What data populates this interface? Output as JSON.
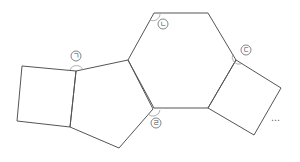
{
  "diagram": {
    "colors": {
      "stroke": "#555555",
      "arc": "#9a9a9a",
      "text": "#444444"
    },
    "shapes": [
      {
        "name": "left-square",
        "points": "22,66 76,71 70,127 17,121"
      },
      {
        "name": "pentagon",
        "points": "76,71 128,60 153,109 119,148 70,127"
      },
      {
        "name": "hexagon",
        "points": "154,13 208,13 236,60 208,108 154,108 128,60"
      },
      {
        "name": "right-square",
        "points": "236,60 281,88 254,135 208,108"
      }
    ],
    "angle_labels": [
      {
        "id": "a",
        "text": "ㄱ",
        "x": 76,
        "y": 56,
        "arc": "M70,70 A7,7 0 0 1 83,70"
      },
      {
        "id": "b",
        "text": "ㄴ",
        "x": 163,
        "y": 24,
        "arc": "M150,20 A7,7 0 0 0 160,14"
      },
      {
        "id": "c",
        "text": "ㄷ",
        "x": 246,
        "y": 50,
        "arc": "M233,54 A7,7 0 0 0 241,64"
      },
      {
        "id": "d",
        "text": "ㄹ",
        "x": 156,
        "y": 123,
        "arc": "M148,114 A7,7 0 0 0 160,110"
      }
    ],
    "continuation": "⋯"
  }
}
